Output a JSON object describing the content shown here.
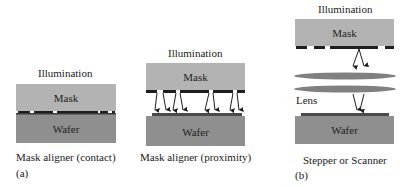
{
  "colors": {
    "mask": "#b3b3b3",
    "wafer": "#8f8f8f",
    "pattern": "#1e1e1e",
    "lens": "#808080",
    "background": "#ffffff"
  },
  "panels": [
    {
      "id": "contact",
      "illumination_label": "Illumination",
      "mask_label": "Mask",
      "wafer_label": "Wafer",
      "caption": "Mask aligner (contact)",
      "sublabel": "(a)"
    },
    {
      "id": "proximity",
      "illumination_label": "Illumination",
      "mask_label": "Mask",
      "wafer_label": "Wafer",
      "caption": "Mask aligner (proximity)"
    },
    {
      "id": "projection",
      "illumination_label": "Illumination",
      "mask_label": "Mask",
      "lens_label": "Lens",
      "wafer_label": "Wafer",
      "caption": "Stepper or Scanner",
      "sublabel": "(b)"
    }
  ]
}
